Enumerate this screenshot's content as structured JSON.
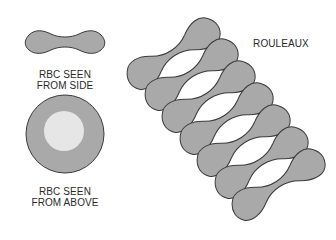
{
  "labels": {
    "side_line1": "RBC SEEN",
    "side_line2": "FROM SIDE",
    "above_line1": "RBC SEEN",
    "above_line2": "FROM ABOVE",
    "rouleaux": "ROULEAUX"
  },
  "colors": {
    "cell_fill": "#a9a9a9",
    "cell_stroke": "#3a3a3a",
    "center_pale": "#e6e6e6",
    "background": "#ffffff"
  },
  "rouleaux": {
    "cell_count": 7
  }
}
